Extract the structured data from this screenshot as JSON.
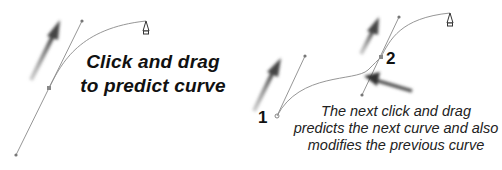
{
  "left_panel": {
    "caption_line1": "Click and drag",
    "caption_line2": "to predict curve"
  },
  "right_panel": {
    "point1_label": "1",
    "point2_label": "2",
    "caption_line1": "The next click and drag",
    "caption_line2": "predicts the next curve and also",
    "caption_line3": "modifies the previous curve"
  },
  "colors": {
    "line": "#8a8a8a",
    "arrow": "#555555",
    "text": "#111111",
    "background": "#ffffff"
  },
  "icons": [
    "pen-cursor-icon",
    "drag-arrow-icon"
  ]
}
